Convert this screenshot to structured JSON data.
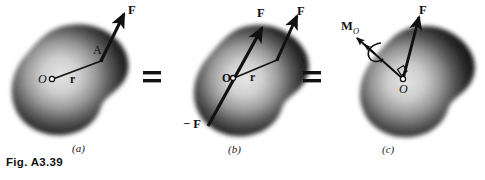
{
  "figure": {
    "caption": "Fig. A3.39",
    "background_color": "#ffffff",
    "ink_color": "#111111",
    "width": 485,
    "height": 180
  },
  "panels": [
    {
      "id": "a",
      "label": "(a)",
      "blob": {
        "name": "rigid-body-blob",
        "shading": "airbrushed dark edges, light center",
        "edge_color": "#1a1a1a",
        "center_color": "#d8d8d8"
      },
      "points": [
        {
          "name": "origin-point",
          "label": "O",
          "style": "italic-serif",
          "x": 43,
          "y": 79
        },
        {
          "name": "application-point",
          "label": "A",
          "style": "serif",
          "x": 97,
          "y": 52
        }
      ],
      "vectors": [
        {
          "name": "force-vector-F",
          "label": "F",
          "style": "bold-serif",
          "label_x": 128,
          "label_y": 10
        },
        {
          "name": "position-vector-r",
          "label": "r",
          "style": "bold-serif",
          "label_x": 72,
          "label_y": 79
        }
      ]
    },
    {
      "id": "b",
      "label": "(b)",
      "blob": {
        "name": "rigid-body-blob",
        "shading": "airbrushed dark edges, light center",
        "edge_color": "#1a1a1a",
        "center_color": "#d8d8d8"
      },
      "points": [
        {
          "name": "origin-point",
          "label": "O",
          "style": "bold-serif",
          "x": 225,
          "y": 78
        }
      ],
      "vectors": [
        {
          "name": "force-vector-F-at-A",
          "label": "F",
          "style": "bold-serif",
          "label_x": 297,
          "label_y": 10
        },
        {
          "name": "force-vector-F-at-O",
          "label": "F",
          "style": "bold-serif",
          "label_x": 260,
          "label_y": 12
        },
        {
          "name": "force-vector-minus-F",
          "label": "− F",
          "style": "bold-serif",
          "label_x": 185,
          "label_y": 119
        },
        {
          "name": "position-vector-r",
          "label": "r",
          "style": "bold-serif",
          "label_x": 251,
          "label_y": 76
        }
      ]
    },
    {
      "id": "c",
      "label": "(c)",
      "blob": {
        "name": "rigid-body-blob",
        "shading": "airbrushed dark edges, light center",
        "edge_color": "#1a1a1a",
        "center_color": "#d8d8d8"
      },
      "points": [
        {
          "name": "origin-point",
          "label": "O",
          "style": "italic-serif",
          "x": 403,
          "y": 87
        }
      ],
      "vectors": [
        {
          "name": "force-vector-F",
          "label": "F",
          "style": "bold-serif",
          "label_x": 422,
          "label_y": 9
        },
        {
          "name": "moment-vector-Mo",
          "label": "M",
          "subscript": "O",
          "style": "bold-serif",
          "label_x": 344,
          "label_y": 21
        }
      ],
      "markers": [
        {
          "name": "right-angle-marker",
          "label": "",
          "x": 396,
          "y": 70
        },
        {
          "name": "rotation-curl-arrow",
          "label": "",
          "x": 372,
          "y": 48
        }
      ]
    }
  ],
  "operators": [
    {
      "name": "equals-sign-1",
      "label": "=",
      "x": 148,
      "y": 62
    },
    {
      "name": "equals-sign-2",
      "label": "=",
      "x": 308,
      "y": 62
    }
  ]
}
